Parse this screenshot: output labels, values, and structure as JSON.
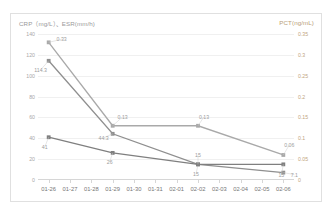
{
  "chart_frame": {
    "left_axis_title": "CRP（mg/L）、ESR(mm/h)",
    "right_axis_title": "PCT(ng/mL)"
  },
  "chart_data": {
    "type": "line",
    "title": "",
    "subtitle": "",
    "xlabel": "",
    "ylabel": "CRP（mg/L）、ESR(mm/h)",
    "y2label": "PCT(ng/mL)",
    "grid": true,
    "legend": "none",
    "categories": [
      "01-26",
      "01-27",
      "01-28",
      "01-29",
      "01-30",
      "01-31",
      "02-01",
      "02-02",
      "02-03",
      "02-04",
      "02-05",
      "02-06"
    ],
    "ylim": [
      0,
      140
    ],
    "yticks": [
      "0",
      "20",
      "40",
      "60",
      "80",
      "100",
      "120",
      "140"
    ],
    "ytick_values": [
      0,
      20,
      40,
      60,
      80,
      100,
      120,
      140
    ],
    "y2lim": [
      0,
      0.35
    ],
    "y2ticks": [
      "0",
      "0.05",
      "0.1",
      "0.15",
      "0.2",
      "0.25",
      "0.3",
      "0.35"
    ],
    "y2tick_values": [
      0,
      0.05,
      0.1,
      0.15,
      0.2,
      0.25,
      0.3,
      0.35
    ],
    "series": [
      {
        "name": "PCT",
        "axis": "right",
        "color": "#a9a9a9",
        "x": [
          "01-26",
          "01-29",
          "02-02",
          "02-06"
        ],
        "values": [
          0.33,
          0.13,
          0.13,
          0.06
        ],
        "labels": [
          "0.33",
          "0.13",
          "0.13",
          "0.06"
        ]
      },
      {
        "name": "CRP",
        "axis": "left",
        "color": "#8f8f8f",
        "x": [
          "01-26",
          "01-29",
          "02-02",
          "02-06"
        ],
        "values": [
          114.3,
          44.3,
          15,
          7.1
        ],
        "labels": [
          "114.3",
          "44.3",
          "15",
          "7.1"
        ]
      },
      {
        "name": "ESR",
        "axis": "left",
        "color": "#7f7f7f",
        "x": [
          "01-26",
          "01-29",
          "02-02",
          "02-06"
        ],
        "values": [
          41,
          26,
          15,
          15
        ],
        "labels": [
          "41",
          "26",
          "15",
          "15"
        ]
      }
    ],
    "annotations": []
  }
}
